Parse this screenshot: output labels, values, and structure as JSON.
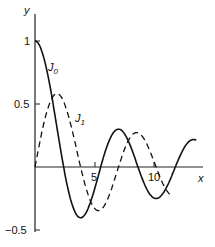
{
  "chart_data": {
    "type": "line",
    "title": "",
    "xlabel": "x",
    "ylabel": "y",
    "xlim": [
      0,
      15
    ],
    "ylim": [
      -0.5,
      1.1
    ],
    "x_ticks": [
      "5",
      "10"
    ],
    "y_ticks": [
      "1",
      "0.5",
      "-0.5"
    ],
    "grid": false,
    "series": [
      {
        "name": "J0",
        "style": "solid",
        "x": [
          0,
          1,
          2,
          2.405,
          3,
          3.83,
          4,
          5,
          5.52,
          6,
          7,
          7.02,
          8,
          8.65,
          9,
          10,
          10.17,
          11,
          11.79,
          12,
          13,
          14
        ],
        "values": [
          1,
          0.765,
          0.224,
          0,
          -0.26,
          -0.403,
          -0.397,
          -0.178,
          0,
          0.151,
          0.3,
          0.3,
          0.172,
          0,
          -0.09,
          -0.246,
          -0.25,
          -0.171,
          0,
          0.048,
          0.207,
          0.171
        ]
      },
      {
        "name": "J1",
        "style": "dashed",
        "x": [
          0,
          1,
          1.84,
          2,
          3,
          3.83,
          4,
          5,
          5.33,
          6,
          7,
          7.02,
          8,
          8.54,
          9,
          10,
          10.17,
          11,
          11.5
        ],
        "values": [
          0,
          0.44,
          0.582,
          0.577,
          0.339,
          0,
          -0.066,
          -0.328,
          -0.346,
          -0.277,
          -0.005,
          0,
          0.235,
          0.273,
          0.245,
          0.043,
          0,
          -0.177,
          -0.24
        ]
      }
    ],
    "annotations": [
      "J0",
      "J1"
    ]
  },
  "labels": {
    "y_axis": "y",
    "x_axis": "x",
    "tick_1": "1",
    "tick_05": "0.5",
    "tick_m05": "−0.5",
    "tick_5": "5",
    "tick_10": "10",
    "j0": "J",
    "j0_sub": "0",
    "j1": "J",
    "j1_sub": "1"
  }
}
